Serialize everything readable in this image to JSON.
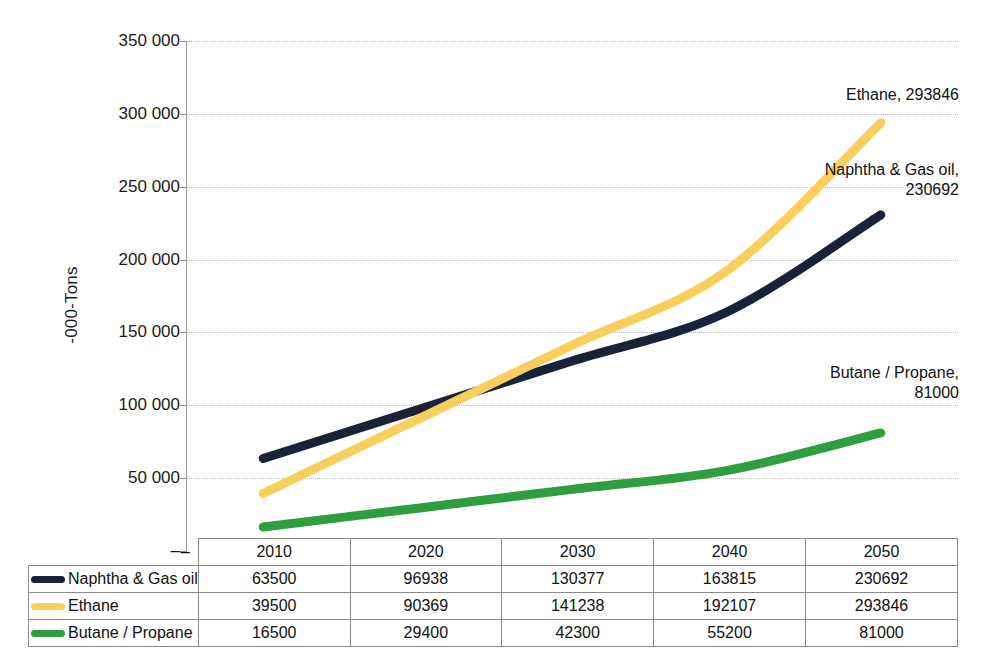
{
  "chart_data": {
    "type": "line",
    "title": "",
    "xlabel": "",
    "ylabel": "-000-Tons",
    "ylim": [
      0,
      350000
    ],
    "grid": true,
    "legend_position": "table-left",
    "categories": [
      "2010",
      "2020",
      "2030",
      "2040",
      "2050"
    ],
    "y_ticks": [
      "–",
      "50 000",
      "100 000",
      "150 000",
      "200 000",
      "250 000",
      "300 000",
      "350 000"
    ],
    "y_tick_values": [
      0,
      50000,
      100000,
      150000,
      200000,
      250000,
      300000,
      350000
    ],
    "series": [
      {
        "name": "Naphtha & Gas oil",
        "color": "#1a2238",
        "values": [
          63500,
          96938,
          130377,
          163815,
          230692
        ],
        "end_label": "Naphtha & Gas oil,\n230692"
      },
      {
        "name": "Ethane",
        "color": "#f8cf5c",
        "values": [
          39500,
          90369,
          141238,
          192107,
          293846
        ],
        "end_label": "Ethane, 293846"
      },
      {
        "name": "Butane / Propane",
        "color": "#2f9e41",
        "values": [
          16500,
          29400,
          42300,
          55200,
          81000
        ],
        "end_label": "Butane / Propane,\n81000"
      }
    ]
  },
  "table": {
    "corner_label": "–",
    "header": [
      "2010",
      "2020",
      "2030",
      "2040",
      "2050"
    ],
    "rows": [
      {
        "label": "Naphtha & Gas oil",
        "color": "#1a2238",
        "values": [
          "63500",
          "96938",
          "130377",
          "163815",
          "230692"
        ]
      },
      {
        "label": "Ethane",
        "color": "#f8cf5c",
        "values": [
          "39500",
          "90369",
          "141238",
          "192107",
          "293846"
        ]
      },
      {
        "label": "Butane / Propane",
        "color": "#2f9e41",
        "values": [
          "16500",
          "29400",
          "42300",
          "55200",
          "81000"
        ]
      }
    ]
  },
  "axis": {
    "y_title": "-000-Tons",
    "ticks": [
      {
        "label": "350 000",
        "y": 41
      },
      {
        "label": "300 000",
        "y": 114
      },
      {
        "label": "250 000",
        "y": 187
      },
      {
        "label": "200 000",
        "y": 260
      },
      {
        "label": "150 000",
        "y": 332
      },
      {
        "label": "100 000",
        "y": 405
      },
      {
        "label": "50 000",
        "y": 478
      },
      {
        "label": "–",
        "y": 551
      }
    ]
  },
  "annotations": [
    {
      "name": "ethane-end-label",
      "text": "Ethane, 293846",
      "x": 713,
      "y": 85
    },
    {
      "name": "naphtha-end-label",
      "text": "Naphtha & Gas oil,\n230692",
      "x": 713,
      "y": 160
    },
    {
      "name": "butane-end-label",
      "text": "Butane / Propane,\n81000",
      "x": 713,
      "y": 363
    }
  ],
  "colors": {
    "naphtha": "#1a2238",
    "ethane": "#f8cf5c",
    "butane": "#2f9e41",
    "grid": "#b9b9b9",
    "axis": "#9a9a9a",
    "background": "#ffffff"
  }
}
